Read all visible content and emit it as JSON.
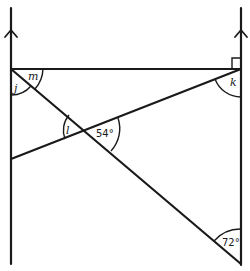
{
  "diagram": {
    "type": "geometry-parallel-lines-angles",
    "labels": {
      "j": "j",
      "m": "m",
      "k": "k",
      "l": "l",
      "angle_center": "54°",
      "angle_bottom_right": "72°"
    },
    "features": {
      "parallel_lines": 2,
      "parallel_arrows": "single arrowheads pointing up",
      "right_angle_marker": "top-right corner between horizontal line and right vertical line"
    },
    "colors": {
      "stroke": "#1a1a1a",
      "background": "#ffffff"
    }
  }
}
